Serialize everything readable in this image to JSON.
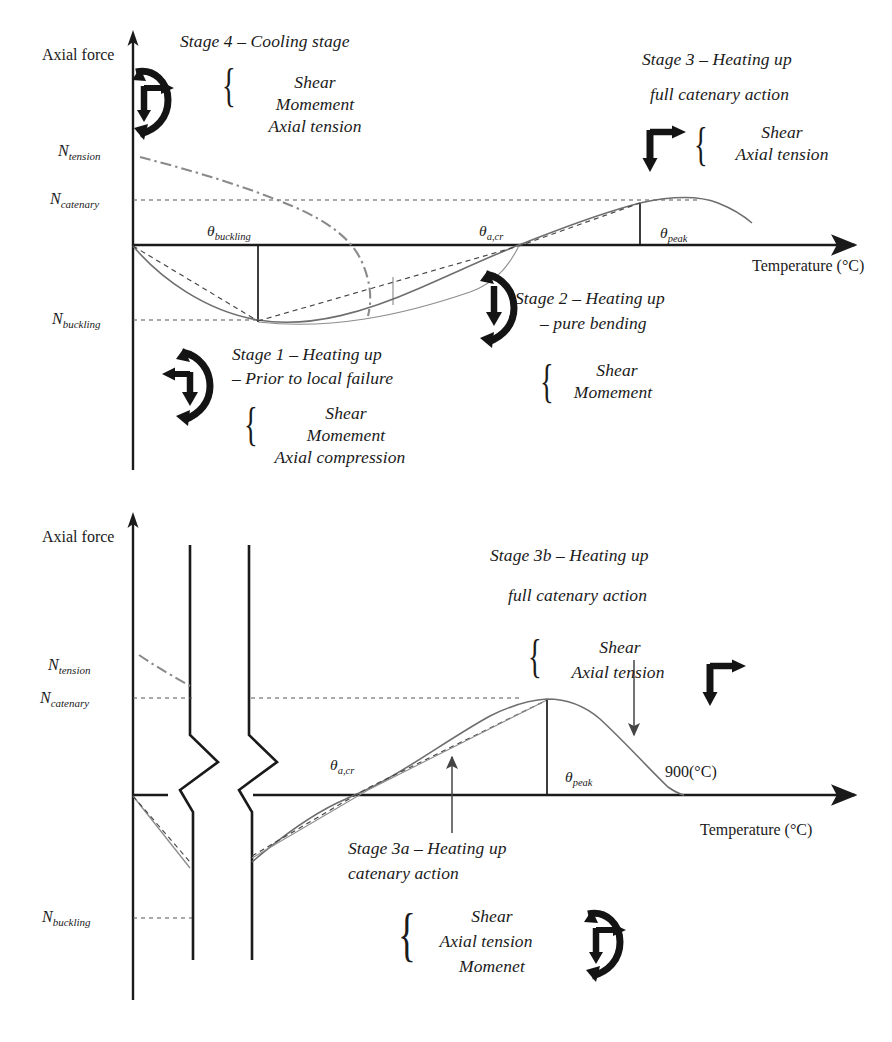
{
  "figure": {
    "charts": [
      {
        "id": "top-chart",
        "axes": {
          "y_axis_label": "Axial force",
          "x_axis_label": "Temperature (°C)",
          "y_ticks": [
            {
              "base": "N",
              "sub": "tension"
            },
            {
              "base": "N",
              "sub": "catenary"
            },
            {
              "base": "N",
              "sub": "buckling"
            }
          ],
          "x_ticks": [
            {
              "base": "θ",
              "sub": "buckling"
            },
            {
              "base": "θ",
              "sub": "a,cr"
            },
            {
              "base": "θ",
              "sub": "peak"
            }
          ]
        },
        "annotations": [
          {
            "id": "stage-4",
            "title_lines": [
              "Stage 4 – Cooling stage"
            ],
            "forces": [
              "Shear",
              "Momement",
              "Axial tension"
            ],
            "icon": "moment-arrow-cw-right"
          },
          {
            "id": "stage-3",
            "title_lines": [
              "Stage 3 – Heating up",
              "full catenary action"
            ],
            "forces": [
              "Shear",
              "Axial tension"
            ],
            "icon": "shear-arrow-corner-right"
          },
          {
            "id": "stage-2",
            "title_lines": [
              "Stage 2 – Heating up",
              "– pure bending"
            ],
            "forces": [
              "Shear",
              "Momement"
            ],
            "icon": "moment-arrow-down-ccw"
          },
          {
            "id": "stage-1",
            "title_lines": [
              "Stage 1 – Heating up",
              "– Prior to local failure"
            ],
            "forces": [
              "Shear",
              "Momement",
              "Axial compression"
            ],
            "icon": "moment-arrow-left-cw"
          }
        ]
      },
      {
        "id": "bottom-chart",
        "axes": {
          "y_axis_label": "Axial force",
          "x_axis_label": "Temperature (°C)",
          "y_ticks": [
            {
              "base": "N",
              "sub": "tension"
            },
            {
              "base": "N",
              "sub": "catenary"
            },
            {
              "base": "N",
              "sub": "buckling"
            }
          ],
          "x_ticks": [
            {
              "base": "θ",
              "sub": "a,cr"
            },
            {
              "base": "θ",
              "sub": "peak"
            }
          ],
          "end_marker": "900(°C)"
        },
        "annotations": [
          {
            "id": "stage-3b",
            "title_lines": [
              "Stage 3b – Heating up",
              "full catenary action"
            ],
            "forces": [
              "Shear",
              "Axial tension"
            ],
            "icon": "shear-arrow-corner-right"
          },
          {
            "id": "stage-3a",
            "title_lines": [
              "Stage 3a – Heating up",
              "catenary action"
            ],
            "forces": [
              "Shear",
              "Axial tension",
              "Momenet"
            ],
            "icon": "moment-arrow-cw-right"
          }
        ]
      }
    ],
    "colors": {
      "ink": "#1a1a1a",
      "curve_gray": "#6e6e6e",
      "dash_gray": "#555555",
      "dashdot_gray": "#8a8a8a"
    }
  }
}
